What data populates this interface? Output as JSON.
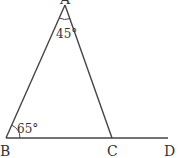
{
  "diagram": {
    "type": "geometry-triangle",
    "points": {
      "A": {
        "label": "A",
        "x": 65,
        "y": 5
      },
      "B": {
        "label": "B",
        "x": 6,
        "y": 138
      },
      "C": {
        "label": "C",
        "x": 112,
        "y": 138
      },
      "D": {
        "label": "D",
        "x": 168,
        "y": 138
      }
    },
    "segments": [
      "AB",
      "AC",
      "BD"
    ],
    "angles": [
      {
        "vertex": "A",
        "label": "45°"
      },
      {
        "vertex": "B",
        "label": "65°"
      }
    ],
    "colors": {
      "stroke": "#444444",
      "text": "#333333",
      "background": "#ffffff"
    }
  }
}
